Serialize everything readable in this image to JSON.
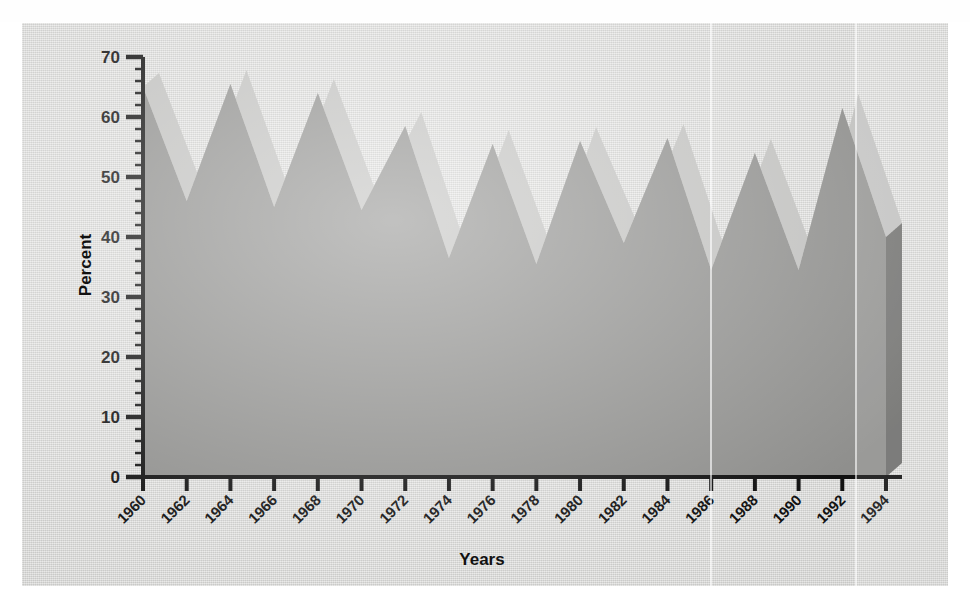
{
  "figure": {
    "ylabel": "Percent",
    "xlabel": "Years",
    "top_cut_text": "",
    "colors": {
      "panel_background": "#d8d8d6",
      "front_face": "#8f8f8d",
      "top_face": "#c0c0be",
      "end_cap": "#6e6e6c",
      "axis": "#111111"
    }
  },
  "chart_data": {
    "type": "area",
    "title": "",
    "subtitle": "",
    "xlabel": "Years",
    "ylabel": "Percent",
    "xlim": [
      1960,
      1994
    ],
    "ylim": [
      0,
      70
    ],
    "grid": false,
    "legend": null,
    "style": "3d-ribbon-area",
    "y_ticks": [
      0,
      10,
      20,
      30,
      40,
      50,
      60,
      70
    ],
    "y_minor_tick_step": 2,
    "x_ticks": [
      1960,
      1962,
      1964,
      1966,
      1968,
      1970,
      1972,
      1974,
      1976,
      1978,
      1980,
      1982,
      1984,
      1986,
      1988,
      1990,
      1992,
      1994
    ],
    "x_tick_rotation": -45,
    "x": [
      1960,
      1961,
      1962,
      1963,
      1964,
      1965,
      1966,
      1967,
      1968,
      1969,
      1970,
      1971,
      1972,
      1973,
      1974,
      1975,
      1976,
      1977,
      1978,
      1979,
      1980,
      1981,
      1982,
      1983,
      1984,
      1985,
      1986,
      1987,
      1988,
      1989,
      1990,
      1991,
      1992,
      1993,
      1994
    ],
    "series": [
      {
        "name": "Percent",
        "values": [
          65.0,
          55.5,
          46.0,
          55.8,
          65.5,
          55.3,
          45.0,
          54.5,
          64.0,
          54.3,
          44.5,
          51.5,
          58.5,
          47.5,
          36.5,
          46.0,
          55.5,
          45.5,
          35.5,
          45.8,
          56.0,
          47.5,
          39.0,
          47.8,
          56.5,
          45.5,
          34.5,
          44.3,
          54.0,
          44.3,
          34.5,
          48.0,
          61.5,
          50.8,
          40.0
        ]
      }
    ],
    "peaks": [
      {
        "year": 1960,
        "value": 65.0
      },
      {
        "year": 1964,
        "value": 65.5
      },
      {
        "year": 1968,
        "value": 64.0
      },
      {
        "year": 1972,
        "value": 58.5
      },
      {
        "year": 1976,
        "value": 55.5
      },
      {
        "year": 1980,
        "value": 56.0
      },
      {
        "year": 1984,
        "value": 56.5
      },
      {
        "year": 1988,
        "value": 54.0
      },
      {
        "year": 1992,
        "value": 61.5
      }
    ],
    "valleys": [
      {
        "year": 1962,
        "value": 46.0
      },
      {
        "year": 1966,
        "value": 45.0
      },
      {
        "year": 1970,
        "value": 44.5
      },
      {
        "year": 1974,
        "value": 36.5
      },
      {
        "year": 1978,
        "value": 35.5
      },
      {
        "year": 1982,
        "value": 39.0
      },
      {
        "year": 1986,
        "value": 34.5
      },
      {
        "year": 1990,
        "value": 34.5
      },
      {
        "year": 1994,
        "value": 40.0
      }
    ]
  }
}
